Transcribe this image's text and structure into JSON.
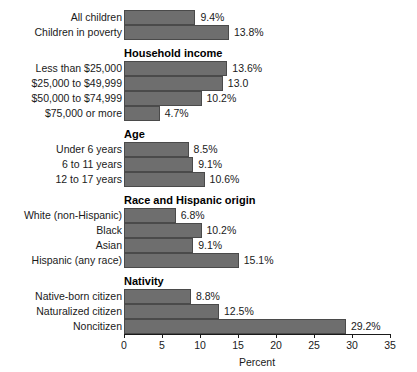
{
  "chart_data": {
    "type": "bar",
    "orientation": "horizontal",
    "title": "",
    "xlabel": "Percent",
    "ylabel": "",
    "xlim": [
      0,
      35
    ],
    "xticks": [
      0,
      5,
      10,
      15,
      20,
      25,
      30,
      35
    ],
    "xtick_labels": [
      "0",
      "5",
      "10",
      "15",
      "20",
      "25",
      "30",
      "35"
    ],
    "grid": false,
    "legend": false,
    "bar_color": "#6e6e6e",
    "bar_edge_color": "#4a4a4a",
    "categories": [
      "All children",
      "Children in poverty",
      "Less than $25,000",
      "$25,000 to $49,999",
      "$50,000 to $74,999",
      "$75,000 or more",
      "Under 6 years",
      "6 to 11 years",
      "12 to 17 years",
      "White (non-Hispanic)",
      "Black",
      "Asian",
      "Hispanic (any race)",
      "Native-born citizen",
      "Naturalized citizen",
      "Noncitizen"
    ],
    "values": [
      9.4,
      13.8,
      13.6,
      13.0,
      10.2,
      4.7,
      8.5,
      9.1,
      10.6,
      6.8,
      10.2,
      9.1,
      15.1,
      8.8,
      12.5,
      29.2
    ],
    "value_labels": [
      "9.4%",
      "13.8%",
      "13.6%",
      "13.0",
      "10.2%",
      "4.7%",
      "8.5%",
      "9.1%",
      "10.6%",
      "6.8%",
      "10.2%",
      "9.1%",
      "15.1%",
      "8.8%",
      "12.5%",
      "29.2%"
    ],
    "group_headers": [
      "Household income",
      "Age",
      "Race and Hispanic origin",
      "Nativity"
    ]
  },
  "groups": [
    {
      "header": "",
      "bars": [
        {
          "label": "All children",
          "value": 9.4,
          "value_label": "9.4%"
        },
        {
          "label": "Children in poverty",
          "value": 13.8,
          "value_label": "13.8%"
        }
      ]
    },
    {
      "header": "Household income",
      "bars": [
        {
          "label": "Less than $25,000",
          "value": 13.6,
          "value_label": "13.6%"
        },
        {
          "label": "$25,000 to $49,999",
          "value": 13.0,
          "value_label": "13.0"
        },
        {
          "label": "$50,000 to $74,999",
          "value": 10.2,
          "value_label": "10.2%"
        },
        {
          "label": "$75,000 or more",
          "value": 4.7,
          "value_label": "4.7%"
        }
      ]
    },
    {
      "header": "Age",
      "bars": [
        {
          "label": "Under 6 years",
          "value": 8.5,
          "value_label": "8.5%"
        },
        {
          "label": "6 to 11 years",
          "value": 9.1,
          "value_label": "9.1%"
        },
        {
          "label": "12 to 17 years",
          "value": 10.6,
          "value_label": "10.6%"
        }
      ]
    },
    {
      "header": "Race and Hispanic origin",
      "bars": [
        {
          "label": "White (non-Hispanic)",
          "value": 6.8,
          "value_label": "6.8%"
        },
        {
          "label": "Black",
          "value": 10.2,
          "value_label": "10.2%"
        },
        {
          "label": "Asian",
          "value": 9.1,
          "value_label": "9.1%"
        },
        {
          "label": "Hispanic (any race)",
          "value": 15.1,
          "value_label": "15.1%"
        }
      ]
    },
    {
      "header": "Nativity",
      "bars": [
        {
          "label": "Native-born citizen",
          "value": 8.8,
          "value_label": "8.8%"
        },
        {
          "label": "Naturalized citizen",
          "value": 12.5,
          "value_label": "12.5%"
        },
        {
          "label": "Noncitizen",
          "value": 29.2,
          "value_label": "29.2%"
        }
      ]
    }
  ],
  "axis": {
    "title": "Percent",
    "ticks": [
      "0",
      "5",
      "10",
      "15",
      "20",
      "25",
      "30",
      "35"
    ]
  }
}
